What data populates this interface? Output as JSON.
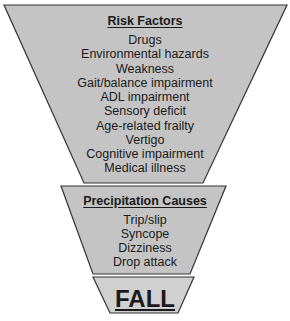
{
  "diagram": {
    "risk_factors": {
      "title": "Risk Factors",
      "items": [
        "Drugs",
        "Environmental hazards",
        "Weakness",
        "Gait/balance impairment",
        "ADL impairment",
        "Sensory deficit",
        "Age-related frailty",
        "Vertigo",
        "Cognitive impairment",
        "Medical illness"
      ]
    },
    "precipitation_causes": {
      "title": "Precipitation Causes",
      "items": [
        "Trip/slip",
        "Syncope",
        "Dizziness",
        "Drop attack"
      ]
    },
    "outcome": {
      "label": "FALL"
    },
    "colors": {
      "fill": "#c4c4c4",
      "stroke": "#333333"
    }
  }
}
